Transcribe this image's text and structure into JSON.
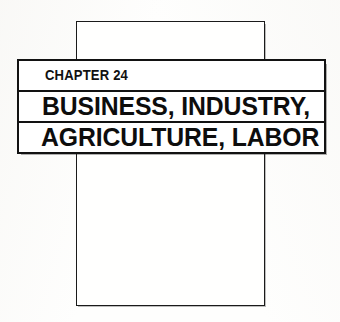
{
  "page": {
    "background_color": "#fefefd",
    "ink_color": "#121212"
  },
  "portrait_frame": {
    "name": "page-outline",
    "border_color": "#1a1a1a"
  },
  "banner": {
    "border_color": "#121212",
    "background_color": "#ffffff",
    "rows": [
      {
        "id": "chapter",
        "label": "CHAPTER 24"
      },
      {
        "id": "title-line-1",
        "label": "BUSINESS, INDUSTRY,"
      },
      {
        "id": "title-line-2",
        "label": "AGRICULTURE, LABOR"
      }
    ],
    "chapter_label": "CHAPTER 24",
    "title_line_1": "BUSINESS, INDUSTRY,",
    "title_line_2": "AGRICULTURE, LABOR"
  }
}
